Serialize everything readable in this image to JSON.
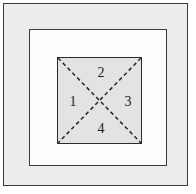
{
  "figure": {
    "canvas": {
      "width": 196,
      "height": 194,
      "background": "#ffffff"
    },
    "frames": [
      {
        "name": "outer-frame",
        "fill": "#ececed",
        "stroke": "#3a3a3a",
        "x": 3,
        "y": 3,
        "width": 185,
        "height": 183
      },
      {
        "name": "middle-square",
        "fill": "#fdfdfd",
        "stroke": "#3a3a3a",
        "x": 28,
        "y": 28,
        "width": 138,
        "height": 137
      },
      {
        "name": "inner-square",
        "fill": "#e3e3e3",
        "stroke": "#2b2b2b",
        "x": 55,
        "y": 55,
        "width": 85,
        "height": 87
      }
    ],
    "diagonals": {
      "style": "dashed",
      "stroke": "#2b2b2b",
      "stroke_width": 1.6,
      "dash_pattern": "4 3",
      "lines": [
        {
          "name": "diagonal-tl-br",
          "x1": 0,
          "y1": 0,
          "x2": 85,
          "y2": 87
        },
        {
          "name": "diagonal-tr-bl",
          "x1": 85,
          "y1": 0,
          "x2": 0,
          "y2": 87
        }
      ]
    },
    "regions": [
      {
        "id": "region-1",
        "label": "1",
        "position": "left",
        "cx": 15,
        "cy": 44
      },
      {
        "id": "region-2",
        "label": "2",
        "position": "top",
        "cx": 43,
        "cy": 15
      },
      {
        "id": "region-3",
        "label": "3",
        "position": "right",
        "cx": 70,
        "cy": 44
      },
      {
        "id": "region-4",
        "label": "4",
        "position": "bottom",
        "cx": 43,
        "cy": 71
      }
    ]
  }
}
